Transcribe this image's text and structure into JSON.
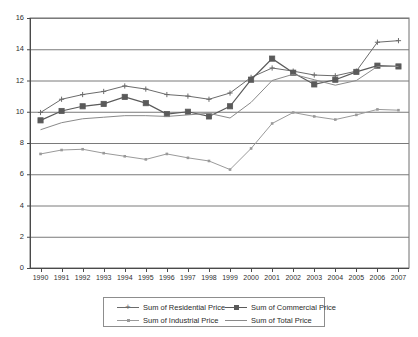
{
  "chart_data": {
    "type": "line",
    "title": "",
    "xlabel": "",
    "ylabel": "",
    "ylim": [
      0,
      16
    ],
    "yticks": [
      0,
      2,
      4,
      6,
      8,
      10,
      12,
      14,
      16
    ],
    "grid": true,
    "legend_position": "bottom",
    "categories": [
      "1990",
      "1991",
      "1992",
      "1993",
      "1994",
      "1995",
      "1996",
      "1997",
      "1998",
      "1999",
      "2000",
      "2001",
      "2002",
      "2003",
      "2004",
      "2005",
      "2006",
      "2007"
    ],
    "series": [
      {
        "name": "Sum of Residential Price",
        "marker": "plus",
        "color": "#6b6b6b",
        "values": [
          9.95,
          10.8,
          11.1,
          11.3,
          11.65,
          11.45,
          11.1,
          11.0,
          10.8,
          11.2,
          12.2,
          12.8,
          12.6,
          12.35,
          12.3,
          12.6,
          14.45,
          14.55
        ]
      },
      {
        "name": "Sum of Commercial Price",
        "marker": "square",
        "color": "#5a5a5a",
        "values": [
          9.45,
          10.05,
          10.35,
          10.5,
          10.95,
          10.55,
          9.85,
          10.0,
          9.7,
          10.35,
          12.05,
          13.4,
          12.5,
          11.75,
          12.05,
          12.55,
          12.95,
          12.9
        ]
      },
      {
        "name": "Sum of Industrial Price",
        "marker": "dot",
        "color": "#9a9a9a",
        "values": [
          7.3,
          7.55,
          7.6,
          7.35,
          7.15,
          6.95,
          7.3,
          7.05,
          6.85,
          6.3,
          7.65,
          9.25,
          9.95,
          9.7,
          9.5,
          9.8,
          10.15,
          10.1
        ]
      },
      {
        "name": "Sum of Total Price",
        "marker": "none",
        "color": "#8a8a8a",
        "values": [
          8.85,
          9.3,
          9.55,
          9.65,
          9.75,
          9.75,
          9.7,
          9.8,
          9.9,
          9.6,
          10.6,
          12.0,
          12.4,
          12.05,
          11.7,
          12.0,
          12.9,
          12.9
        ]
      }
    ]
  },
  "legend": {
    "items": [
      {
        "label": "Sum of Residential Price"
      },
      {
        "label": "Sum of Commercial Price"
      },
      {
        "label": "Sum of Industrial Price"
      },
      {
        "label": "Sum of Total Price"
      }
    ]
  }
}
